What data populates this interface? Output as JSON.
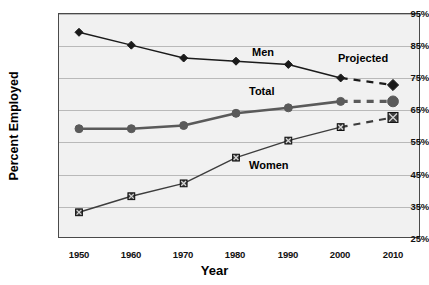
{
  "chart_data": {
    "type": "line",
    "title": "",
    "xlabel": "Year",
    "ylabel": "Percent Employed",
    "categories": [
      1950,
      1960,
      1970,
      1980,
      1990,
      2000,
      2010
    ],
    "x": [
      1950,
      1960,
      1970,
      1980,
      1990,
      2000,
      2010
    ],
    "xlim": [
      1945,
      2015
    ],
    "ylim": [
      25,
      95
    ],
    "ytick_labels": [
      "95%",
      "85%",
      "75%",
      "65%",
      "55%",
      "45%",
      "35%",
      "25%"
    ],
    "ytick_values": [
      95,
      85,
      75,
      65,
      55,
      45,
      35,
      25
    ],
    "xtick_labels": [
      "1950",
      "1960",
      "1970",
      "1980",
      "1990",
      "2000",
      "2010"
    ],
    "grid": "horizontal",
    "legend": "inline-annotations",
    "series": [
      {
        "name": "Men",
        "marker": "diamond",
        "color": "#1a1a1a",
        "values": [
          89.0,
          85.0,
          81.0,
          80.0,
          79.0,
          74.8,
          72.6
        ],
        "observed_through": 2000,
        "projected_from": 2000
      },
      {
        "name": "Total",
        "marker": "circle",
        "color": "#5a5a5a",
        "values": [
          59.0,
          59.0,
          60.0,
          63.8,
          65.5,
          67.5,
          67.5
        ],
        "observed_through": 2000,
        "projected_from": 2000
      },
      {
        "name": "Women",
        "marker": "square-x",
        "color": "#3d3d3d",
        "values": [
          33.0,
          38.0,
          42.0,
          50.0,
          55.3,
          59.5,
          62.5
        ],
        "observed_through": 2000,
        "projected_from": 2000
      }
    ],
    "annotations": [
      {
        "text": "Men",
        "series": "Men"
      },
      {
        "text": "Total",
        "series": "Total"
      },
      {
        "text": "Women",
        "series": "Women"
      },
      {
        "text": "Projected",
        "series": null
      }
    ]
  },
  "axes": {
    "y_title": "Percent Employed",
    "x_title": "Year",
    "y_ticks": [
      "95%",
      "85%",
      "75%",
      "65%",
      "55%",
      "45%",
      "35%",
      "25%"
    ],
    "x_ticks": [
      "1950",
      "1960",
      "1970",
      "1980",
      "1990",
      "2000",
      "2010"
    ]
  },
  "labels": {
    "men": "Men",
    "total": "Total",
    "women": "Women",
    "projected": "Projected"
  },
  "colors": {
    "plot_background": "#f1f1f1",
    "plot_border": "#4a4a4a",
    "gridline": "#b9b9b9",
    "men": "#1a1a1a",
    "total": "#5a5a5a",
    "women": "#3d3d3d",
    "text": "#000000"
  }
}
